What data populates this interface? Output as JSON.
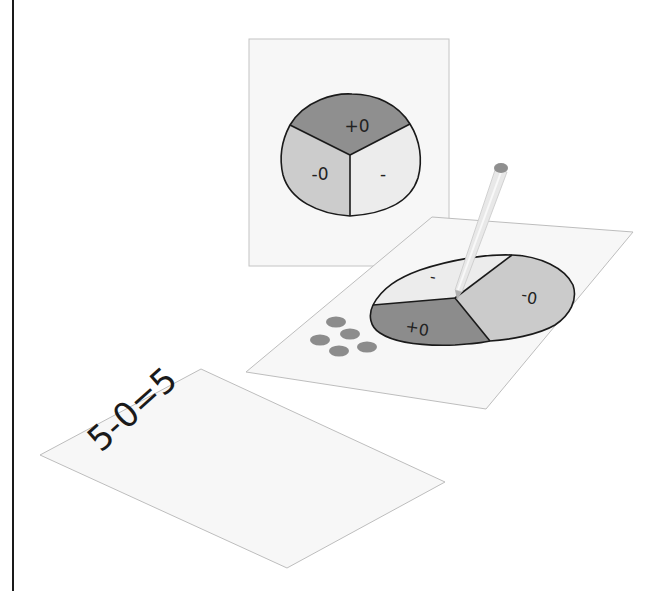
{
  "illustration": {
    "top_card": {
      "spinner_labels": {
        "top": "+0",
        "left": "-0",
        "right": "-"
      }
    },
    "middle_card": {
      "spinner_labels": {
        "dark": "0+",
        "medium": "0-",
        "light": "-"
      },
      "counter_dots": 5
    },
    "bottom_card": {
      "equation": "5-0=5"
    }
  },
  "colors": {
    "paper": "#f7f7f7",
    "paper_edge": "#bcbcbc",
    "dark_sector": "#8a8a8a",
    "medium_sector": "#cacaca",
    "light_sector": "#eeeeee",
    "outline": "#1a1a1a",
    "dot": "#8c8c8c",
    "pencil": "#e6e6e6",
    "eraser": "#8f8f8f"
  }
}
